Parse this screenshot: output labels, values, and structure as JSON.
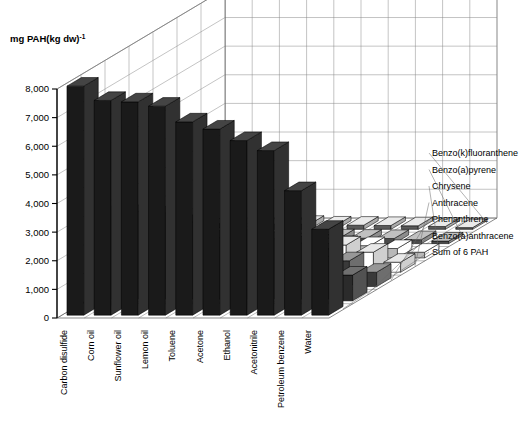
{
  "figure": {
    "axis_title": "mg PAH(kg dw)",
    "axis_title_exp": "-1",
    "y_ticks": [
      "0",
      "1,000",
      "2,000",
      "3,000",
      "4,000",
      "5,000",
      "6,000",
      "7,000",
      "8,000"
    ]
  },
  "chart_data": {
    "type": "bar",
    "title": "",
    "xlabel": "",
    "ylabel": "mg PAH(kg dw)-1",
    "ylim": [
      0,
      8000
    ],
    "grid": true,
    "projection": "3d",
    "legend_position": "right",
    "categories": [
      "Carbon disulfide",
      "Corn oil",
      "Sunflower oil",
      "Lemon oil",
      "Toluene",
      "Acetone",
      "Ethanol",
      "Acetonitrile",
      "Petroleum benzene",
      "Water"
    ],
    "series": [
      {
        "name": "Sum of 6 PAH",
        "color": "#1a1a1a",
        "values": [
          8000,
          7500,
          7450,
          7300,
          6750,
          6500,
          6100,
          5750,
          4350,
          3000
        ]
      },
      {
        "name": "Benzo(a)anthracene",
        "color": "#2b2b2b",
        "values": [
          3000,
          3050,
          3000,
          2700,
          2150,
          2200,
          2100,
          1950,
          1500,
          900
        ]
      },
      {
        "name": "Phenanthrene",
        "color": "#3a3a3a",
        "values": [
          1900,
          1750,
          1700,
          1600,
          1400,
          1350,
          1300,
          1200,
          900,
          500
        ]
      },
      {
        "name": "Anthracene",
        "color": "#ffffff",
        "values": [
          1350,
          1300,
          1250,
          1400,
          1100,
          1050,
          1000,
          950,
          700,
          350
        ]
      },
      {
        "name": "Chrysene",
        "color": "#b8b8b8",
        "values": [
          700,
          650,
          620,
          600,
          520,
          500,
          470,
          430,
          330,
          200
        ]
      },
      {
        "name": "Benzo(a)pyrene",
        "color": "#4a4a4a",
        "values": [
          280,
          260,
          250,
          240,
          210,
          200,
          190,
          180,
          140,
          90
        ]
      },
      {
        "name": "Benzo(k)fluoranthene",
        "color": "#5a5a5a",
        "values": [
          200,
          190,
          180,
          175,
          150,
          145,
          135,
          125,
          100,
          60
        ]
      }
    ]
  }
}
